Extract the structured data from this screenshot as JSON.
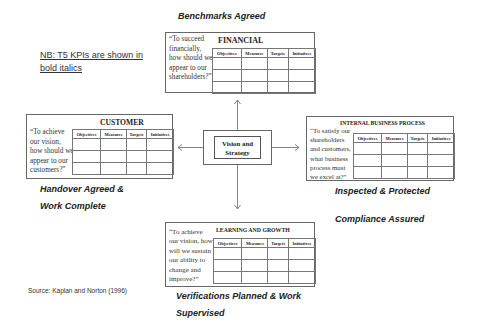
{
  "note": {
    "line1": "NB: T5 KPIs are shown in",
    "line2": "bold italics"
  },
  "table_headers": [
    "Objectives",
    "Measures",
    "Targets",
    "Initiatives"
  ],
  "center": {
    "line1": "Vision and",
    "line2": "Strategy"
  },
  "perspectives": {
    "financial": {
      "title": "FINANCIAL",
      "quote": [
        "“To succeed",
        "financially,",
        "how should we",
        "appear to our",
        "shareholders?”"
      ],
      "kpi": [
        "Benchmarks Agreed"
      ]
    },
    "customer": {
      "title": "CUSTOMER",
      "quote": [
        "“To achieve",
        "our vision,",
        "how should we",
        "appear to our",
        "customers?”"
      ],
      "kpi": [
        "Handover Agreed &",
        "Work Complete"
      ]
    },
    "internal": {
      "title": "INTERNAL  BUSINESS  PROCESS",
      "quote": [
        "“To satisfy our",
        "shareholders",
        "and customers,",
        "what business",
        "process must",
        "we excel at?”"
      ],
      "kpi": [
        "Inspected & Protected",
        "Compliance Assured"
      ]
    },
    "learning": {
      "title": "LEARNING  AND  GROWTH",
      "quote": [
        "“To achieve",
        "our vision, how",
        "will we sustain",
        "our ability to",
        "change and",
        "improve?”"
      ],
      "kpi": [
        "Verifications Planned & Work",
        "Supervised"
      ]
    }
  },
  "source": "Source:  Kaplan and Norton  (1996)",
  "colors": {
    "border": "#666666",
    "text": "#222222",
    "background": "#ffffff"
  }
}
